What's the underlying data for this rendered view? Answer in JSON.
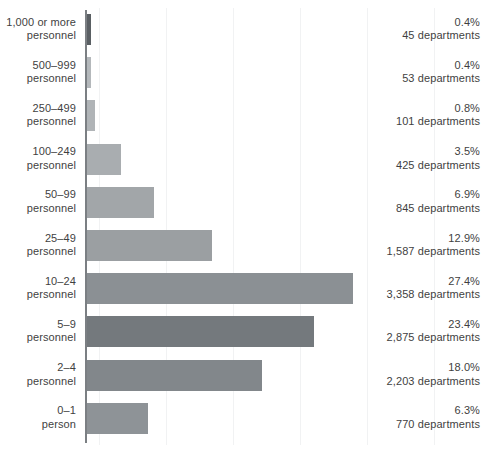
{
  "chart_data": {
    "type": "bar",
    "orientation": "horizontal",
    "title": "",
    "subtitle": "",
    "xlabel": "",
    "ylabel": "",
    "grid": true,
    "legend": false,
    "axis_visible": "category-axis-left",
    "categories": [
      "1,000 or more personnel",
      "500–999 personnel",
      "250–499 personnel",
      "100–249 personnel",
      "50–99 personnel",
      "25–49 personnel",
      "10–24 personnel",
      "5–9 personnel",
      "2–4 personnel",
      "0–1 person"
    ],
    "values": [
      0.4,
      0.4,
      0.8,
      3.5,
      6.9,
      12.9,
      27.4,
      23.4,
      18.0,
      6.3
    ],
    "counts": [
      45,
      53,
      101,
      425,
      845,
      1587,
      3358,
      2875,
      2203,
      770
    ],
    "xlim": [
      0,
      27.4
    ],
    "value_unit": "%",
    "count_unit": "departments"
  },
  "rows": [
    {
      "label_line1": "1,000 or more",
      "label_line2": "personnel",
      "percent": "0.4%",
      "count": "45 departments",
      "color": "#5a5f63"
    },
    {
      "label_line1": "500–999",
      "label_line2": "personnel",
      "percent": "0.4%",
      "count": "53 departments",
      "color": "#b4b8bb"
    },
    {
      "label_line1": "250–499",
      "label_line2": "personnel",
      "percent": "0.8%",
      "count": "101 departments",
      "color": "#b0b4b7"
    },
    {
      "label_line1": "100–249",
      "label_line2": "personnel",
      "percent": "3.5%",
      "count": "425 departments",
      "color": "#a9adb0"
    },
    {
      "label_line1": "50–99",
      "label_line2": "personnel",
      "percent": "6.9%",
      "count": "845 departments",
      "color": "#a2a6a9"
    },
    {
      "label_line1": "25–49",
      "label_line2": "personnel",
      "percent": "12.9%",
      "count": "1,587 departments",
      "color": "#9b9fa2"
    },
    {
      "label_line1": "10–24",
      "label_line2": "personnel",
      "percent": "27.4%",
      "count": "3,358 departments",
      "color": "#8b9094"
    },
    {
      "label_line1": "5–9",
      "label_line2": "personnel",
      "percent": "23.4%",
      "count": "2,875 departments",
      "color": "#74797d"
    },
    {
      "label_line1": "2–4",
      "label_line2": "personnel",
      "percent": "18.0%",
      "count": "2,203 departments",
      "color": "#82878b"
    },
    {
      "label_line1": "0–1",
      "label_line2": "person",
      "percent": "6.3%",
      "count": "770 departments",
      "color": "#8e9397"
    }
  ],
  "colors": {
    "axis": "#7b7f83",
    "text": "#3f3f3f",
    "gridline": "#f1f2f3",
    "background": "#ffffff"
  }
}
